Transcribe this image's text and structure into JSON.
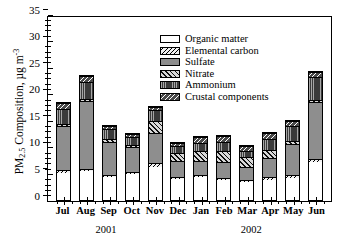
{
  "chart_data": {
    "type": "bar",
    "subtype": "stacked",
    "title": "",
    "xlabel": "",
    "ylabel": "PM2.5 Composition, µg m-3",
    "ylabel_parts": {
      "prefix": "PM",
      "sub": "2.5",
      "mid": " Composition, µg m",
      "sup": "-3"
    },
    "ylim": [
      0,
      35
    ],
    "yticks": [
      0,
      5,
      10,
      15,
      20,
      25,
      30,
      35
    ],
    "ytick_labels": [
      "0",
      "5",
      "10",
      "15",
      "20",
      "25",
      "30",
      "35"
    ],
    "grid": false,
    "legend_position": "top-center",
    "categories": [
      "Jul",
      "Aug",
      "Sep",
      "Oct",
      "Nov",
      "Dec",
      "Jan",
      "Feb",
      "Mar",
      "Apr",
      "May",
      "Jun"
    ],
    "group_labels": [
      {
        "label": "2001",
        "span": "Jul-Dec"
      },
      {
        "label": "2002",
        "span": "Jan-Jun"
      }
    ],
    "series": [
      {
        "name": "Organic matter",
        "pattern": "p-organic",
        "values": [
          5.1,
          5.4,
          4.3,
          4.9,
          6.3,
          4.0,
          4.3,
          3.8,
          3.3,
          3.8,
          4.2,
          7.2
        ]
      },
      {
        "name": "Elemental carbon",
        "pattern": "p-ec",
        "values": [
          0.5,
          0.5,
          0.4,
          0.4,
          0.6,
          0.4,
          0.4,
          0.4,
          0.4,
          0.5,
          0.5,
          0.6
        ]
      },
      {
        "name": "Sulfate",
        "pattern": "p-sulfate",
        "values": [
          8.3,
          12.7,
          6.2,
          4.6,
          5.8,
          2.9,
          2.7,
          2.9,
          2.5,
          3.6,
          5.8,
          10.6
        ]
      },
      {
        "name": "Nitrate",
        "pattern": "p-nitrate",
        "values": [
          0.4,
          0.5,
          0.5,
          0.4,
          2.2,
          1.6,
          1.9,
          2.1,
          1.9,
          1.6,
          0.6,
          0.4
        ]
      },
      {
        "name": "Ammonium",
        "pattern": "p-ammonium",
        "values": [
          2.9,
          3.1,
          1.9,
          1.6,
          2.0,
          1.3,
          1.5,
          1.7,
          1.2,
          1.9,
          2.9,
          4.4
        ]
      },
      {
        "name": "Crustal components",
        "pattern": "p-crustal",
        "values": [
          1.0,
          1.1,
          0.6,
          0.5,
          0.7,
          0.6,
          1.0,
          1.2,
          0.8,
          1.2,
          0.8,
          0.8
        ]
      }
    ],
    "totals": [
      18.2,
      23.3,
      13.9,
      12.4,
      17.6,
      10.8,
      11.8,
      12.1,
      10.1,
      12.6,
      14.8,
      24.0
    ]
  },
  "legend": {
    "items": [
      {
        "label": "Organic matter"
      },
      {
        "label": "Elemental carbon"
      },
      {
        "label": "Sulfate"
      },
      {
        "label": "Nitrate"
      },
      {
        "label": "Ammonium"
      },
      {
        "label": "Crustal components"
      }
    ]
  }
}
